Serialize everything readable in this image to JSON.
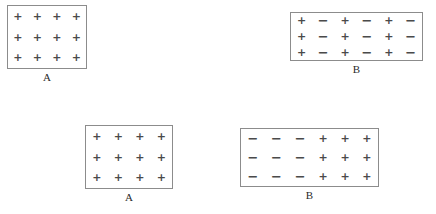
{
  "figure": {
    "background_color": "#ffffff",
    "border_color": "#8c8c8c",
    "symbol_color": "#4a4a4a",
    "label_color": "#2b2b2b",
    "plus_symbol": "+",
    "minus_symbol": "−"
  },
  "panels": [
    {
      "id": "top-left",
      "label": "A",
      "columns": 4,
      "rows": 3,
      "grid": [
        [
          "+",
          "+",
          "+",
          "+"
        ],
        [
          "+",
          "+",
          "+",
          "+"
        ],
        [
          "+",
          "+",
          "+",
          "+"
        ]
      ]
    },
    {
      "id": "top-right",
      "label": "B",
      "columns": 6,
      "rows": 3,
      "grid": [
        [
          "+",
          "−",
          "+",
          "−",
          "+",
          "−"
        ],
        [
          "+",
          "−",
          "+",
          "−",
          "+",
          "−"
        ],
        [
          "+",
          "−",
          "+",
          "−",
          "+",
          "−"
        ]
      ]
    },
    {
      "id": "bottom-left",
      "label": "A",
      "columns": 4,
      "rows": 3,
      "grid": [
        [
          "+",
          "+",
          "+",
          "+"
        ],
        [
          "+",
          "+",
          "+",
          "+"
        ],
        [
          "+",
          "+",
          "+",
          "+"
        ]
      ]
    },
    {
      "id": "bottom-right",
      "label": "B",
      "columns": 6,
      "rows": 3,
      "grid": [
        [
          "−",
          "−",
          "−",
          "+",
          "+",
          "+"
        ],
        [
          "−",
          "−",
          "−",
          "+",
          "+",
          "+"
        ],
        [
          "−",
          "−",
          "−",
          "+",
          "+",
          "+"
        ]
      ]
    }
  ]
}
